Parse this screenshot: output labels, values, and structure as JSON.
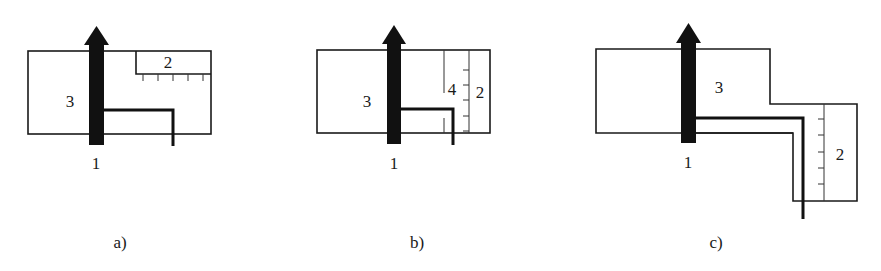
{
  "figure": {
    "panels": [
      {
        "id": "a",
        "caption": "a)",
        "labels": {
          "arrow": "1",
          "scale": "2",
          "body": "3"
        },
        "scale_ticks": 5
      },
      {
        "id": "b",
        "caption": "b)",
        "labels": {
          "arrow": "1",
          "scale": "2",
          "body": "3",
          "inner": "4"
        },
        "scale_ticks": 5
      },
      {
        "id": "c",
        "caption": "c)",
        "labels": {
          "arrow": "1",
          "scale": "2",
          "body": "3"
        },
        "scale_ticks": 5
      }
    ]
  },
  "colors": {
    "line": "#1a1a1a",
    "arrow": "#111111",
    "background": "#ffffff"
  }
}
